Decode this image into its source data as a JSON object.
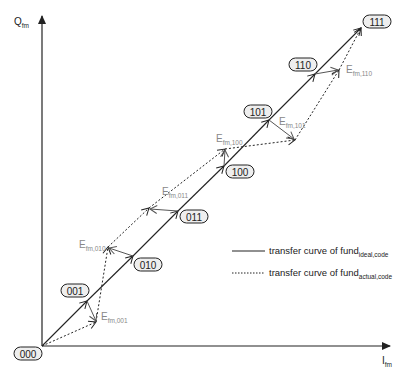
{
  "axes": {
    "y_label": "Q",
    "y_label_sub": "fm",
    "x_label": "I",
    "x_label_sub": "fm"
  },
  "codes": [
    "000",
    "001",
    "010",
    "011",
    "100",
    "101",
    "110",
    "111"
  ],
  "errors": [
    {
      "label": "E",
      "sub": "fm,001"
    },
    {
      "label": "E",
      "sub": "fm,010"
    },
    {
      "label": "E",
      "sub": "fm,011"
    },
    {
      "label": "E",
      "sub": "fm,100"
    },
    {
      "label": "E",
      "sub": "fm,101"
    },
    {
      "label": "E",
      "sub": "fm,110"
    }
  ],
  "legend": {
    "ideal": {
      "text": "transfer curve of fund",
      "sub": "ideal,code",
      "style": "solid"
    },
    "actual": {
      "text": "transfer curve of fund",
      "sub": "actual,code",
      "style": "dotted"
    }
  },
  "colors": {
    "line": "#222222",
    "error_vector": "#666666",
    "error_label": "#888888",
    "code_box_fill": "#eeeeee"
  },
  "diagram_points": {
    "ideal": [
      [
        42,
        346
      ],
      [
        87,
        301
      ],
      [
        133,
        256
      ],
      [
        178,
        211
      ],
      [
        224,
        166
      ],
      [
        269,
        120
      ],
      [
        315,
        74
      ],
      [
        361,
        28
      ]
    ],
    "actual": [
      [
        42,
        346
      ],
      [
        96,
        322
      ],
      [
        108,
        247
      ],
      [
        149,
        208
      ],
      [
        225,
        149
      ],
      [
        295,
        140
      ],
      [
        339,
        70
      ],
      [
        361,
        28
      ]
    ]
  }
}
